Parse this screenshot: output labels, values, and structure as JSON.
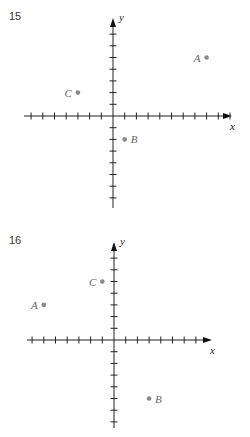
{
  "page": {
    "clipped_header_text": ""
  },
  "chart_data": [
    {
      "type": "scatter",
      "problem_number": "15",
      "title": "",
      "xlabel": "x",
      "ylabel": "y",
      "grid": false,
      "unit_tick_spacing": 1,
      "xlim": [
        -7,
        10
      ],
      "ylim": [
        -7,
        7
      ],
      "points": [
        {
          "label": "A",
          "x": 8,
          "y": 5
        },
        {
          "label": "B",
          "x": 1,
          "y": -2
        },
        {
          "label": "C",
          "x": -3,
          "y": 2
        }
      ]
    },
    {
      "type": "scatter",
      "problem_number": "16",
      "title": "",
      "xlabel": "x",
      "ylabel": "y",
      "grid": false,
      "unit_tick_spacing": 1,
      "xlim": [
        -7,
        7
      ],
      "ylim": [
        -7,
        7
      ],
      "points": [
        {
          "label": "A",
          "x": -6,
          "y": 3
        },
        {
          "label": "B",
          "x": 3,
          "y": -5
        },
        {
          "label": "C",
          "x": -1,
          "y": 5
        }
      ]
    }
  ],
  "layout": {
    "graphs": [
      {
        "origin": [
          113,
          116
        ],
        "unit": 11.7,
        "xticks_left": 7,
        "xticks_right": 10,
        "yticks_up": 7,
        "yticks_down": 7,
        "x_end": 232,
        "y_top": 18,
        "y_bottom": 208,
        "x_start": 24,
        "label_top": 12
      },
      {
        "origin": [
          114,
          340
        ],
        "unit": 11.7,
        "xticks_left": 7,
        "xticks_right": 7,
        "yticks_up": 7,
        "yticks_down": 7,
        "x_end": 212,
        "y_top": 242,
        "y_bottom": 428,
        "x_start": 27,
        "label_top": 236
      }
    ]
  }
}
